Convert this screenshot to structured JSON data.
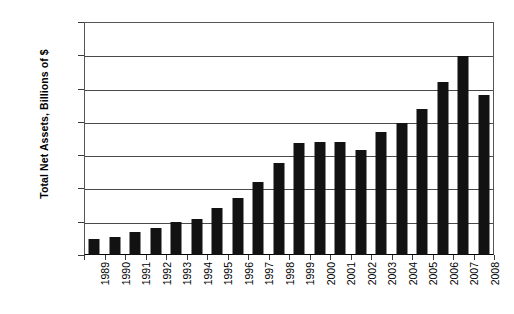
{
  "chart_data": {
    "type": "bar",
    "title": "",
    "xlabel": "",
    "ylabel": "Total Net Assets, Billions of $",
    "ylim": [
      0,
      14000
    ],
    "ytick_labels": [
      "14,000",
      "12,000",
      "10,000",
      "8,000",
      "6,000",
      "4,000",
      "2,000",
      "0"
    ],
    "ytick_values": [
      14000,
      12000,
      10000,
      8000,
      6000,
      4000,
      2000,
      0
    ],
    "grid": true,
    "legend": "none",
    "bar_color": "#121212",
    "categories": [
      "1989",
      "1990",
      "1991",
      "1992",
      "1993",
      "1994",
      "1995",
      "1996",
      "1997",
      "1998",
      "1999",
      "2000",
      "2001",
      "2002",
      "2003",
      "2004",
      "2005",
      "2006",
      "2007",
      "2008"
    ],
    "values": [
      980,
      1070,
      1390,
      1650,
      2010,
      2150,
      2800,
      3400,
      4400,
      5500,
      6750,
      6800,
      6800,
      6300,
      7400,
      7950,
      8800,
      10400,
      11950,
      9600
    ]
  }
}
